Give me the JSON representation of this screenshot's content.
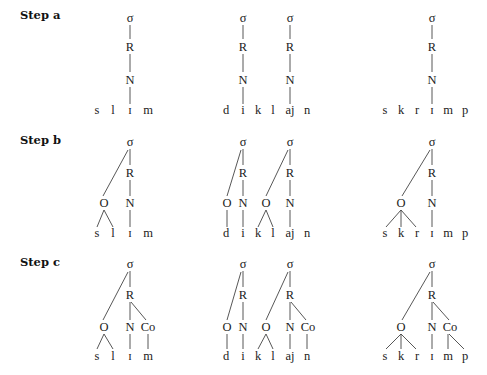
{
  "steps": [
    {
      "label": "Step a"
    },
    {
      "label": "Step b"
    },
    {
      "label": "Step c"
    }
  ],
  "symbols": {
    "syllable": "σ",
    "rhyme": "R",
    "nucleus": "N",
    "onset": "O",
    "coda": "Co"
  },
  "words": [
    {
      "id": "slim",
      "segments": [
        "s",
        "l",
        "ɪ",
        "m"
      ]
    },
    {
      "id": "dikl",
      "segments": [
        "d",
        "i",
        "k",
        "l",
        "aj",
        "n"
      ]
    },
    {
      "id": "skrimp",
      "segments": [
        "s",
        "k",
        "r",
        "ɪ",
        "m",
        "p"
      ]
    }
  ]
}
